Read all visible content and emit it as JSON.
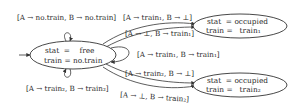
{
  "diagram": {
    "type": "state-transition-diagram",
    "states": {
      "free": {
        "line1": "stat  =    free",
        "line2": "train = no.train",
        "initial": true
      },
      "occ1": {
        "line1": "stat  = occupied",
        "line2": "train =   train₁"
      },
      "occ2": {
        "line1": "stat  = occupied",
        "line2": "train =   train₂"
      }
    },
    "transitions": {
      "self_top": {
        "from": "free",
        "to": "free",
        "label": "[A → no.train, B → no.train]"
      },
      "self_bottom": {
        "from": "free",
        "to": "free",
        "label": "[A → train₂, B → train₂]"
      },
      "to_occ1_a": {
        "from": "free",
        "to": "occ1",
        "label": "[A → train₁, B → ⊥]"
      },
      "to_occ1_b": {
        "from": "free",
        "to": "occ1",
        "label": "[A → ⊥, B → train₁]"
      },
      "self_right": {
        "from": "free",
        "to": "free",
        "label": "[A → train₁, B → train₁]"
      },
      "to_occ2_a": {
        "from": "free",
        "to": "occ2",
        "label": "[A → train₂, B → ⊥]"
      },
      "to_occ2_b": {
        "from": "free",
        "to": "occ2",
        "label": "[A → ⊥, B → train₂]"
      }
    }
  }
}
